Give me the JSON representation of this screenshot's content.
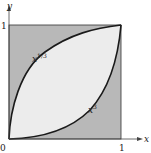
{
  "diagram": {
    "title": "",
    "axes": {
      "x_label": "x",
      "y_label": "y",
      "origin_label": "0",
      "x_tick_label": "1",
      "y_tick_label": "1"
    },
    "curves": [
      {
        "name": "upper",
        "label_base": "x",
        "label_exp": "1/3",
        "formula": "y = x^(1/3)"
      },
      {
        "name": "lower",
        "label_base": "x",
        "label_exp": "3",
        "formula": "y = x^3"
      }
    ],
    "regions": {
      "square_fill": "#b8b8b8",
      "between_curves_fill": "#ececec",
      "stroke": "#1a1a1a"
    }
  }
}
